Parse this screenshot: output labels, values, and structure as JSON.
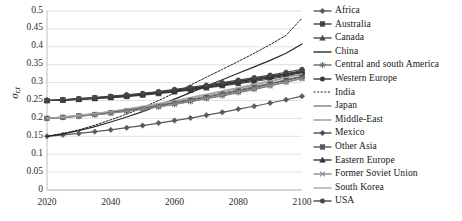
{
  "chart_data": {
    "type": "line",
    "title": "",
    "xlabel": "",
    "ylabel": "σr,t",
    "ylabel_base": "σ",
    "ylabel_sub": "r,t",
    "xlim": [
      2020,
      2100
    ],
    "ylim": [
      0,
      0.5
    ],
    "grid": true,
    "grid_axis": "y",
    "legend_position": "right",
    "x_ticks": [
      "2020",
      "2040",
      "2060",
      "2080",
      "2100"
    ],
    "x_tick_values": [
      2020,
      2040,
      2060,
      2080,
      2100
    ],
    "y_ticks": [
      "0",
      "0.05",
      "0.1",
      "0.15",
      "0.2",
      "0.25",
      "0.3",
      "0.35",
      "0.4",
      "0.45",
      "0.5"
    ],
    "y_tick_values": [
      0,
      0.05,
      0.1,
      0.15,
      0.2,
      0.25,
      0.3,
      0.35,
      0.4,
      0.45,
      0.5
    ],
    "x": [
      2020,
      2025,
      2030,
      2035,
      2040,
      2045,
      2050,
      2055,
      2060,
      2065,
      2070,
      2075,
      2080,
      2085,
      2090,
      2095,
      2100
    ],
    "series": [
      {
        "name": "Africa",
        "marker": "diamond",
        "dash": "solid",
        "color": "#595959",
        "values": [
          0.15,
          0.154,
          0.158,
          0.163,
          0.168,
          0.174,
          0.18,
          0.187,
          0.194,
          0.201,
          0.209,
          0.217,
          0.226,
          0.234,
          0.243,
          0.252,
          0.262
        ]
      },
      {
        "name": "Australia",
        "marker": "square",
        "dash": "solid",
        "color": "#404040",
        "values": [
          0.25,
          0.252,
          0.254,
          0.257,
          0.26,
          0.263,
          0.267,
          0.272,
          0.277,
          0.283,
          0.289,
          0.295,
          0.302,
          0.309,
          0.316,
          0.323,
          0.33
        ]
      },
      {
        "name": "Canada",
        "marker": "triangle",
        "dash": "solid",
        "color": "#4a4a4a",
        "values": [
          0.25,
          0.251,
          0.253,
          0.255,
          0.258,
          0.261,
          0.265,
          0.269,
          0.274,
          0.279,
          0.285,
          0.291,
          0.297,
          0.303,
          0.31,
          0.317,
          0.324
        ]
      },
      {
        "name": "China",
        "marker": "none",
        "dash": "solid",
        "color": "#2a2a2a",
        "values": [
          0.15,
          0.157,
          0.166,
          0.177,
          0.19,
          0.204,
          0.219,
          0.236,
          0.254,
          0.272,
          0.29,
          0.308,
          0.326,
          0.344,
          0.362,
          0.382,
          0.408
        ]
      },
      {
        "name": "Central and south America",
        "marker": "star",
        "dash": "solid",
        "color": "#6b6b6b",
        "values": [
          0.2,
          0.203,
          0.206,
          0.21,
          0.215,
          0.22,
          0.226,
          0.232,
          0.239,
          0.247,
          0.255,
          0.263,
          0.272,
          0.281,
          0.291,
          0.301,
          0.312
        ]
      },
      {
        "name": "Western Europe",
        "marker": "circle",
        "dash": "solid",
        "color": "#383838",
        "values": [
          0.25,
          0.251,
          0.253,
          0.256,
          0.259,
          0.262,
          0.266,
          0.271,
          0.276,
          0.281,
          0.287,
          0.293,
          0.3,
          0.306,
          0.313,
          0.32,
          0.327
        ]
      },
      {
        "name": "India",
        "marker": "none",
        "dash": "dotted",
        "color": "#1f1f1f",
        "values": [
          0.15,
          0.158,
          0.168,
          0.181,
          0.196,
          0.212,
          0.23,
          0.25,
          0.271,
          0.293,
          0.315,
          0.337,
          0.359,
          0.382,
          0.406,
          0.432,
          0.48
        ]
      },
      {
        "name": "Japan",
        "marker": "none",
        "dash": "solid",
        "color": "#808080",
        "values": [
          0.2,
          0.203,
          0.207,
          0.212,
          0.217,
          0.223,
          0.23,
          0.237,
          0.245,
          0.253,
          0.262,
          0.271,
          0.28,
          0.289,
          0.298,
          0.308,
          0.318
        ]
      },
      {
        "name": "Middle-East",
        "marker": "none",
        "dash": "solid",
        "color": "#999999",
        "values": [
          0.2,
          0.204,
          0.208,
          0.213,
          0.219,
          0.225,
          0.232,
          0.24,
          0.248,
          0.257,
          0.266,
          0.275,
          0.284,
          0.293,
          0.303,
          0.313,
          0.323
        ]
      },
      {
        "name": "Mexico",
        "marker": "diamond",
        "dash": "solid",
        "color": "#4d4d4d",
        "values": [
          0.25,
          0.252,
          0.255,
          0.258,
          0.261,
          0.265,
          0.269,
          0.274,
          0.279,
          0.285,
          0.291,
          0.297,
          0.304,
          0.311,
          0.318,
          0.325,
          0.333
        ]
      },
      {
        "name": "Other Asia",
        "marker": "square",
        "dash": "solid",
        "color": "#555555",
        "values": [
          0.2,
          0.203,
          0.207,
          0.211,
          0.216,
          0.222,
          0.228,
          0.235,
          0.243,
          0.251,
          0.259,
          0.268,
          0.277,
          0.286,
          0.296,
          0.306,
          0.316
        ]
      },
      {
        "name": "Eastern Europe",
        "marker": "triangle",
        "dash": "solid",
        "color": "#333333",
        "values": [
          0.25,
          0.252,
          0.254,
          0.257,
          0.26,
          0.264,
          0.268,
          0.273,
          0.278,
          0.284,
          0.29,
          0.296,
          0.303,
          0.31,
          0.317,
          0.324,
          0.331
        ]
      },
      {
        "name": "Former Soviet Union",
        "marker": "x",
        "dash": "solid",
        "color": "#8c8c8c",
        "values": [
          0.2,
          0.203,
          0.206,
          0.21,
          0.215,
          0.22,
          0.226,
          0.233,
          0.24,
          0.248,
          0.256,
          0.265,
          0.274,
          0.283,
          0.292,
          0.302,
          0.311
        ]
      },
      {
        "name": "South Korea",
        "marker": "none",
        "dash": "solid",
        "color": "#a6a6a6",
        "values": [
          0.2,
          0.204,
          0.209,
          0.214,
          0.22,
          0.227,
          0.234,
          0.242,
          0.25,
          0.259,
          0.268,
          0.277,
          0.286,
          0.296,
          0.305,
          0.315,
          0.325
        ]
      },
      {
        "name": "USA",
        "marker": "circle",
        "dash": "solid",
        "color": "#464646",
        "values": [
          0.25,
          0.252,
          0.255,
          0.258,
          0.262,
          0.266,
          0.27,
          0.275,
          0.281,
          0.287,
          0.293,
          0.3,
          0.307,
          0.314,
          0.321,
          0.329,
          0.337
        ]
      }
    ]
  },
  "legend": {
    "items": [
      {
        "label": "Africa"
      },
      {
        "label": "Australia"
      },
      {
        "label": "Canada"
      },
      {
        "label": "China"
      },
      {
        "label": "Central and south America"
      },
      {
        "label": "Western Europe"
      },
      {
        "label": "India"
      },
      {
        "label": "Japan"
      },
      {
        "label": "Middle-East"
      },
      {
        "label": "Mexico"
      },
      {
        "label": "Other Asia"
      },
      {
        "label": "Eastern Europe"
      },
      {
        "label": "Former Soviet Union"
      },
      {
        "label": "South Korea"
      },
      {
        "label": "USA"
      }
    ]
  },
  "style": {
    "plot_bg": "#ffffff",
    "gridline_color": "#d9d9d9",
    "axis_color": "#bfbfbf",
    "text_color": "#1a1a1a"
  }
}
